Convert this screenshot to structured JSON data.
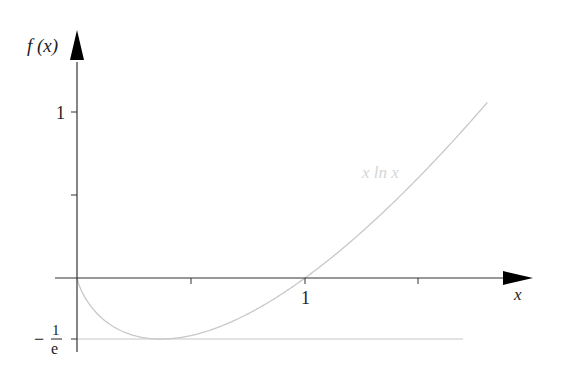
{
  "chart_data": {
    "type": "line",
    "title": "",
    "xlabel": "x",
    "ylabel": "f(x)",
    "series": [
      {
        "name": "x ln x",
        "x": [
          0.0,
          0.05,
          0.1,
          0.2,
          0.3,
          0.3679,
          0.5,
          0.7,
          1.0,
          1.2,
          1.4,
          1.6,
          1.8
        ],
        "values": [
          0.0,
          -0.15,
          -0.23,
          -0.322,
          -0.361,
          -0.368,
          -0.347,
          -0.25,
          0.0,
          0.219,
          0.471,
          0.752,
          1.058
        ],
        "color": "#c8c8c8"
      },
      {
        "name": "y = -1/e asymptote line",
        "x": [
          0.0,
          1.7
        ],
        "values": [
          -0.3679,
          -0.3679
        ],
        "color": "#c8c8c8"
      }
    ],
    "x_ticks": [
      0.5,
      1.0,
      1.5
    ],
    "x_tick_labels": [
      "",
      "1",
      ""
    ],
    "y_ticks": [
      -0.3679,
      0.5,
      1.0
    ],
    "y_tick_labels": [
      "−1/e",
      "",
      "1"
    ],
    "xlim": [
      0,
      1.9
    ],
    "ylim": [
      -0.45,
      1.4
    ],
    "grid": false,
    "legend": "inline label near curve"
  },
  "labels": {
    "y_axis": "f (x)",
    "x_axis": "x",
    "y_tick_one": "1",
    "x_tick_one": "1",
    "neg_sign": "−",
    "frac_num": "1",
    "frac_den": "e",
    "curve_label": "x  ln x"
  }
}
